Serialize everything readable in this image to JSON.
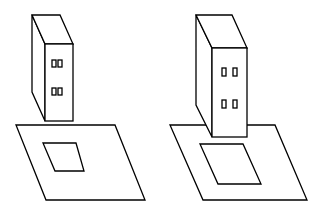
{
  "diagram": {
    "stroke_color": "#000000",
    "background": "#ffffff",
    "figures": [
      {
        "name": "left",
        "building": {
          "back_top_left": [
            32,
            15
          ],
          "back_top_right": [
            60,
            15
          ],
          "front_top_left": [
            45,
            44
          ],
          "front_top_right": [
            73,
            44
          ],
          "front_bottom_left": [
            45,
            121
          ],
          "front_bottom_right": [
            73,
            121
          ],
          "back_bottom_left": [
            32,
            92
          ]
        },
        "windows": [
          [
            52,
            60
          ],
          [
            58,
            60
          ],
          [
            52,
            88
          ],
          [
            58,
            88
          ]
        ],
        "plane": [
          [
            16,
            125
          ],
          [
            115,
            125
          ],
          [
            145,
            200
          ],
          [
            46,
            200
          ]
        ],
        "footprint": [
          [
            43,
            143
          ],
          [
            76,
            143
          ],
          [
            84,
            171
          ],
          [
            55,
            171
          ]
        ]
      },
      {
        "name": "right",
        "building": {
          "back_top_left": [
            196,
            15
          ],
          "back_top_right": [
            232,
            15
          ],
          "front_top_left": [
            212,
            48
          ],
          "front_top_right": [
            247,
            48
          ],
          "front_bottom_left": [
            212,
            137
          ],
          "front_bottom_right": [
            247,
            137
          ],
          "back_bottom_left": [
            196,
            105
          ]
        },
        "windows": [
          [
            222,
            68
          ],
          [
            233,
            68
          ],
          [
            222,
            101
          ],
          [
            233,
            101
          ]
        ],
        "plane": [
          [
            170,
            125
          ],
          [
            275,
            125
          ],
          [
            307,
            200
          ],
          [
            203,
            200
          ]
        ],
        "footprint": [
          [
            200,
            144
          ],
          [
            243,
            144
          ],
          [
            261,
            184
          ],
          [
            218,
            184
          ]
        ]
      }
    ]
  }
}
